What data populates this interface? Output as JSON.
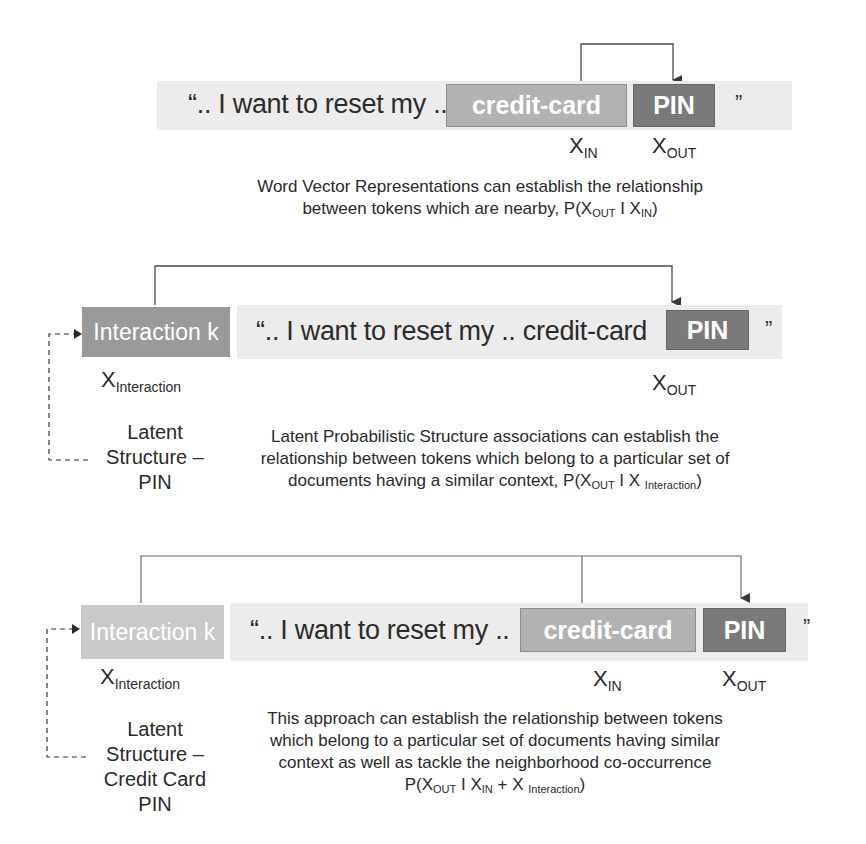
{
  "diagram": {
    "sections": [
      {
        "id": "word-vector",
        "sentence": "“.. I want to reset my ..",
        "token_in": "credit-card",
        "token_out": "PIN",
        "quote_close": "”",
        "labels": {
          "x_in_base": "X",
          "x_in_sub": "IN",
          "x_out_base": "X",
          "x_out_sub": "OUT"
        },
        "caption_line1": "Word Vector Representations can establish the relationship",
        "caption_line2_prefix": "between tokens which are nearby, P(X",
        "caption_sub_out": "OUT",
        "caption_mid": " I X",
        "caption_sub_in": "IN",
        "caption_end": ")"
      },
      {
        "id": "latent-structure",
        "interaction_box": "Interaction k",
        "sentence": "“.. I want to reset my ..   credit-card",
        "token_out": "PIN",
        "quote_close": "”",
        "labels": {
          "x_interaction_base": "X",
          "x_interaction_sub": "Interaction",
          "x_out_base": "X",
          "x_out_sub": "OUT"
        },
        "latent_lines": [
          "Latent",
          "Structure –",
          "PIN"
        ],
        "caption_line1": "Latent Probabilistic Structure associations can establish the",
        "caption_line2": "relationship between tokens which belong to a particular set of",
        "caption_line3_prefix": "documents having a similar context, P(X",
        "caption_sub_out": "OUT",
        "caption_mid": " I X ",
        "caption_sub_interaction": "Interaction",
        "caption_end": ")"
      },
      {
        "id": "combined",
        "interaction_box": "Interaction k",
        "sentence": "“.. I want to reset my ..",
        "token_in": "credit-card",
        "token_out": "PIN",
        "quote_close": "”",
        "labels": {
          "x_interaction_base": "X",
          "x_interaction_sub": "Interaction",
          "x_in_base": "X",
          "x_in_sub": "IN",
          "x_out_base": "X",
          "x_out_sub": "OUT"
        },
        "latent_lines": [
          "Latent",
          "Structure –",
          "Credit Card",
          "PIN"
        ],
        "caption_line1": "This approach can establish the relationship between tokens",
        "caption_line2": "which belong to a particular set of documents having similar",
        "caption_line3": "context as well as tackle the neighborhood co-occurrence",
        "caption_line4_prefix": "P(X",
        "caption_sub_out": "OUT",
        "caption_mid": " I X",
        "caption_sub_in": "IN",
        "caption_plus": " + X ",
        "caption_sub_interaction": "Interaction",
        "caption_end": ")"
      }
    ],
    "colors": {
      "band": "#ececec",
      "credit_card_box": "#b2b2b2",
      "pin_box": "#7a7a7a",
      "interaction_box_dark": "#9a9a9a",
      "interaction_box_light": "#c9c9c9",
      "connector": "#555555"
    }
  }
}
